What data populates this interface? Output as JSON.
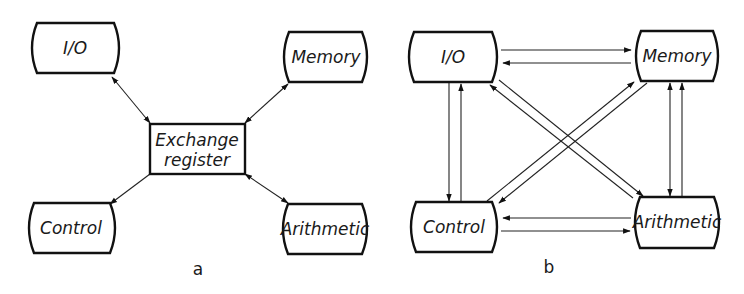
{
  "diagram_a": {
    "caption": "a",
    "nodes": {
      "io": "I/O",
      "memory": "Memory",
      "exchange_line1": "Exchange",
      "exchange_line2": "register",
      "control": "Control",
      "arithmetic": "Arithmetic"
    },
    "edges": [
      {
        "from": "Exchange register",
        "to": "I/O",
        "direction": "bidirectional"
      },
      {
        "from": "Exchange register",
        "to": "Memory",
        "direction": "bidirectional"
      },
      {
        "from": "Exchange register",
        "to": "Control",
        "direction": "to Control"
      },
      {
        "from": "Exchange register",
        "to": "Arithmetic",
        "direction": "bidirectional"
      }
    ]
  },
  "diagram_b": {
    "caption": "b",
    "nodes": {
      "io": "I/O",
      "memory": "Memory",
      "control": "Control",
      "arithmetic": "Arithmetic"
    },
    "edges": [
      {
        "from": "I/O",
        "to": "Memory"
      },
      {
        "from": "Memory",
        "to": "I/O"
      },
      {
        "from": "Arithmetic",
        "to": "Control"
      },
      {
        "from": "Control",
        "to": "Arithmetic"
      },
      {
        "from": "I/O",
        "to": "Control"
      },
      {
        "from": "Control",
        "to": "I/O"
      },
      {
        "from": "Memory",
        "to": "Arithmetic"
      },
      {
        "from": "Arithmetic",
        "to": "Memory"
      },
      {
        "from": "Memory",
        "to": "Control"
      },
      {
        "from": "Control",
        "to": "Memory"
      },
      {
        "from": "I/O",
        "to": "Arithmetic"
      },
      {
        "from": "Arithmetic",
        "to": "I/O"
      }
    ]
  }
}
